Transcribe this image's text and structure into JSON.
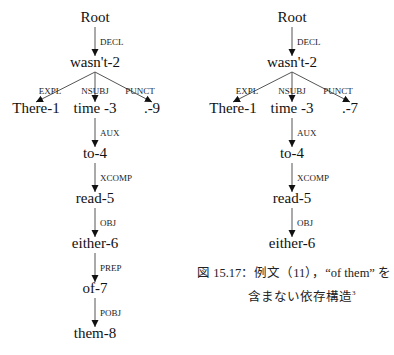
{
  "trees": [
    {
      "id": "left-tree",
      "center_x": 95,
      "nodes": [
        {
          "id": "root",
          "label": "Root",
          "x": 95,
          "y": 22
        },
        {
          "id": "n2",
          "label": "wasn't-2",
          "x": 95,
          "y": 67
        },
        {
          "id": "n1",
          "label": "There-1",
          "x": 36,
          "y": 113
        },
        {
          "id": "n3",
          "label": "time -3",
          "x": 95,
          "y": 113
        },
        {
          "id": "n9",
          "label": ".-9",
          "x": 152,
          "y": 113
        },
        {
          "id": "n4",
          "label": "to-4",
          "x": 95,
          "y": 158
        },
        {
          "id": "n5",
          "label": "read-5",
          "x": 95,
          "y": 203
        },
        {
          "id": "n6",
          "label": "either-6",
          "x": 95,
          "y": 248
        },
        {
          "id": "n7",
          "label": "of-7",
          "x": 95,
          "y": 293
        },
        {
          "id": "n8",
          "label": "them-8",
          "x": 95,
          "y": 338
        }
      ],
      "edges": [
        {
          "from": "root",
          "to": "n2",
          "label": "DECL"
        },
        {
          "from": "n2",
          "to": "n1",
          "label": "EXPL"
        },
        {
          "from": "n2",
          "to": "n3",
          "label": "NSUBJ"
        },
        {
          "from": "n2",
          "to": "n9",
          "label": "PUNCT"
        },
        {
          "from": "n3",
          "to": "n4",
          "label": "AUX"
        },
        {
          "from": "n4",
          "to": "n5",
          "label": "XCOMP"
        },
        {
          "from": "n5",
          "to": "n6",
          "label": "OBJ"
        },
        {
          "from": "n6",
          "to": "n7",
          "label": "PREP"
        },
        {
          "from": "n7",
          "to": "n8",
          "label": "POBJ"
        }
      ]
    },
    {
      "id": "right-tree",
      "center_x": 292,
      "nodes": [
        {
          "id": "root",
          "label": "Root",
          "x": 292,
          "y": 22
        },
        {
          "id": "n2",
          "label": "wasn't-2",
          "x": 292,
          "y": 67
        },
        {
          "id": "n1",
          "label": "There-1",
          "x": 233,
          "y": 113
        },
        {
          "id": "n3",
          "label": "time -3",
          "x": 292,
          "y": 113
        },
        {
          "id": "n7",
          "label": ".-7",
          "x": 350,
          "y": 113
        },
        {
          "id": "n4",
          "label": "to-4",
          "x": 292,
          "y": 158
        },
        {
          "id": "n5",
          "label": "read-5",
          "x": 292,
          "y": 203
        },
        {
          "id": "n6",
          "label": "either-6",
          "x": 292,
          "y": 248
        }
      ],
      "edges": [
        {
          "from": "root",
          "to": "n2",
          "label": "DECL"
        },
        {
          "from": "n2",
          "to": "n1",
          "label": "EXPL"
        },
        {
          "from": "n2",
          "to": "n3",
          "label": "NSUBJ"
        },
        {
          "from": "n2",
          "to": "n7",
          "label": "PUNCT"
        },
        {
          "from": "n3",
          "to": "n4",
          "label": "AUX"
        },
        {
          "from": "n4",
          "to": "n5",
          "label": "XCOMP"
        },
        {
          "from": "n5",
          "to": "n6",
          "label": "OBJ"
        }
      ]
    }
  ],
  "caption": {
    "line1": "図 15.17：例文（11），“of them” を",
    "line2": "含まない依存構造",
    "footnote_mark": "3"
  }
}
